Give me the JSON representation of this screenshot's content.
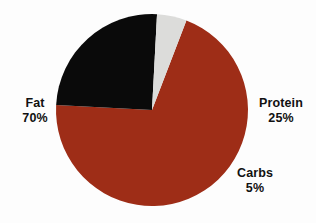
{
  "chart_data": {
    "type": "pie",
    "title": "",
    "subtitle": "",
    "xlabel": "",
    "ylabel": "",
    "legend_position": "none",
    "grid": false,
    "labels_inside": false,
    "categories": [
      "Fat",
      "Protein",
      "Carbs"
    ],
    "values": [
      70,
      25,
      5
    ],
    "units": "%",
    "slices": [
      {
        "name": "Fat",
        "value": 70,
        "value_text": "70%",
        "color": "#9e2d17",
        "label_position": "left"
      },
      {
        "name": "Protein",
        "value": 25,
        "value_text": "25%",
        "color": "#0a0a0a",
        "label_position": "right"
      },
      {
        "name": "Carbs",
        "value": 5,
        "value_text": "5%",
        "color": "#dcdcda",
        "label_position": "bottom-right"
      }
    ],
    "total": 100,
    "start_angle_deg": 21,
    "direction": "clockwise",
    "center": {
      "x": 152,
      "y": 110
    },
    "radius": 96,
    "background_color": "#fdfdfd",
    "label_text_color": "#111111"
  },
  "labels": {
    "fat": {
      "name": "Fat",
      "value": "70%"
    },
    "protein": {
      "name": "Protein",
      "value": "25%"
    },
    "carbs": {
      "name": "Carbs",
      "value": "5%"
    }
  }
}
